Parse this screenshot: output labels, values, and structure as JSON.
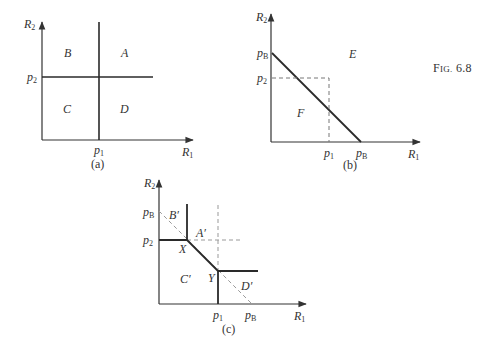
{
  "figure": {
    "label_prefix": "F",
    "label_rest": "IG.",
    "number": "6.8"
  },
  "panels": {
    "a": {
      "caption": "(a)",
      "x_axis": {
        "var": "R",
        "sub": "1"
      },
      "y_axis": {
        "var": "R",
        "sub": "2"
      },
      "x_tick": {
        "var": "p",
        "sub": "1"
      },
      "y_tick": {
        "var": "p",
        "sub": "2"
      },
      "regions": [
        "A",
        "B",
        "C",
        "D"
      ]
    },
    "b": {
      "caption": "(b)",
      "x_axis": {
        "var": "R",
        "sub": "1"
      },
      "y_axis": {
        "var": "R",
        "sub": "2"
      },
      "x_ticks": [
        {
          "var": "p",
          "sub": "1"
        },
        {
          "var": "p",
          "sub": "B"
        }
      ],
      "y_ticks": [
        {
          "var": "p",
          "sub": "B"
        },
        {
          "var": "p",
          "sub": "2"
        }
      ],
      "regions": [
        "E",
        "F"
      ]
    },
    "c": {
      "caption": "(c)",
      "x_axis": {
        "var": "R",
        "sub": "1"
      },
      "y_axis": {
        "var": "R",
        "sub": "2"
      },
      "x_ticks": [
        {
          "var": "p",
          "sub": "1"
        },
        {
          "var": "p",
          "sub": "B"
        }
      ],
      "y_ticks": [
        {
          "var": "p",
          "sub": "B"
        },
        {
          "var": "p",
          "sub": "2"
        }
      ],
      "regions": [
        "A′",
        "B′",
        "C′",
        "D′"
      ],
      "points": [
        "X",
        "Y"
      ]
    }
  },
  "colors": {
    "line": "#2a2a2a",
    "dashed": "#9a9a9a",
    "axis": "#333333"
  }
}
